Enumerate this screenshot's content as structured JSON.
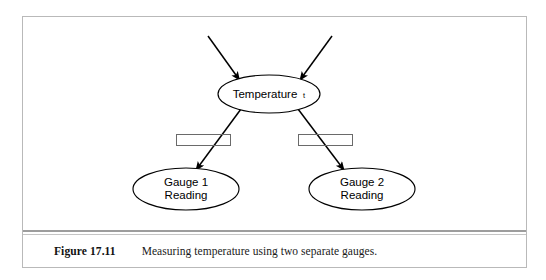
{
  "figure": {
    "caption_number": "Figure 17.11",
    "caption_text": "Measuring temperature using two separate gauges.",
    "diagram_type": "bayesian-network",
    "colors": {
      "background": "#ffffff",
      "stroke": "#000000",
      "frame": "#b9b9b9",
      "gate_box": "#6a6a6a",
      "rule": "#7d7d7d"
    },
    "nodes": [
      {
        "id": "temperature",
        "label": "Temperature",
        "subscript": "t",
        "shape": "ellipse",
        "cx": 269,
        "cy": 94,
        "rx": 51,
        "ry": 19
      },
      {
        "id": "gauge1",
        "label_line1": "Gauge 1",
        "label_line2": "Reading",
        "shape": "ellipse",
        "cx": 186,
        "cy": 189,
        "rx": 53,
        "ry": 21
      },
      {
        "id": "gauge2",
        "label_line1": "Gauge 2",
        "label_line2": "Reading",
        "shape": "ellipse",
        "cx": 362,
        "cy": 189,
        "rx": 53,
        "ry": 21
      }
    ],
    "edges": [
      {
        "id": "incoming-left",
        "from": "external",
        "to": "temperature",
        "arrowhead": true
      },
      {
        "id": "incoming-right",
        "from": "external",
        "to": "temperature",
        "arrowhead": true
      },
      {
        "id": "temperature-to-gauge1",
        "from": "temperature",
        "to": "gauge1",
        "arrowhead": true
      },
      {
        "id": "temperature-to-gauge2",
        "from": "temperature",
        "to": "gauge2",
        "arrowhead": true
      }
    ],
    "gate_boxes": [
      {
        "id": "gate-left",
        "label": "",
        "x": 176,
        "y": 134,
        "width": 54,
        "height": 11
      },
      {
        "id": "gate-right",
        "label": "",
        "x": 298,
        "y": 134,
        "width": 54,
        "height": 11
      }
    ]
  }
}
